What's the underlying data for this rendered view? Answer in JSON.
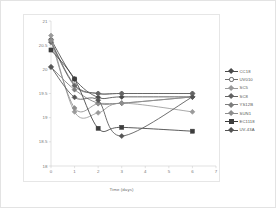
{
  "chart_data": {
    "type": "line",
    "title": "",
    "xlabel": "Time (days)",
    "ylabel": "Soluble Solids (Brix)",
    "xlim": [
      0,
      7
    ],
    "ylim": [
      18,
      21
    ],
    "xticks": [
      0,
      1,
      2,
      3,
      4,
      5,
      6,
      7
    ],
    "yticks": [
      18,
      18.5,
      19,
      19.5,
      20,
      20.5,
      21
    ],
    "xtick_labels": [
      "0",
      "1",
      "2",
      "3",
      "4",
      "5",
      "6",
      "7"
    ],
    "ytick_labels": [
      "18",
      "18.5",
      "19",
      "19.5",
      "20",
      "20.5",
      "21"
    ],
    "grid": false,
    "legend_position": "right",
    "x": [
      0,
      1,
      2,
      3,
      6
    ],
    "series": [
      {
        "name": "CC18",
        "color": "#4a4a4a",
        "marker": "diamond",
        "filled": true,
        "values": [
          20.62,
          19.8,
          19.42,
          19.43,
          19.43
        ]
      },
      {
        "name": "UV010",
        "color": "#6f6f6f",
        "marker": "circle",
        "filled": false,
        "values": [
          20.58,
          19.68,
          19.5,
          19.5,
          19.5
        ]
      },
      {
        "name": "SC5",
        "color": "#9a9a9a",
        "marker": "diamond",
        "filled": true,
        "values": [
          20.7,
          19.12,
          19.1,
          19.3,
          19.12
        ]
      },
      {
        "name": "SC8",
        "color": "#636363",
        "marker": "diamond",
        "filled": true,
        "values": [
          20.56,
          19.66,
          19.5,
          19.5,
          19.5
        ]
      },
      {
        "name": "YS12B",
        "color": "#7d7d7d",
        "marker": "diamond",
        "filled": true,
        "values": [
          20.05,
          19.58,
          19.3,
          19.3,
          19.43
        ]
      },
      {
        "name": "SUN1",
        "color": "#8d8d8d",
        "marker": "diamond",
        "filled": true,
        "values": [
          20.6,
          19.2,
          19.29,
          19.3,
          19.43
        ]
      },
      {
        "name": "EC1118",
        "color": "#3d3d3d",
        "marker": "square",
        "filled": true,
        "values": [
          20.4,
          19.8,
          18.78,
          18.8,
          18.72
        ]
      },
      {
        "name": "UV-43A",
        "color": "#555555",
        "marker": "diamond",
        "filled": true,
        "values": [
          20.05,
          19.42,
          19.36,
          18.62,
          19.43
        ]
      }
    ]
  },
  "axes": {
    "x_title": "Time (days)",
    "y_title": "Soluble Solids (Brix)"
  }
}
